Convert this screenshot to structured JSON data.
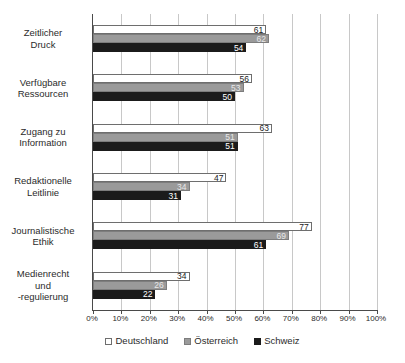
{
  "chart_data": {
    "type": "bar",
    "orientation": "horizontal",
    "title": "",
    "xlabel": "",
    "ylabel": "",
    "xlim": [
      0,
      100
    ],
    "xtick_labels": [
      "0%",
      "10%",
      "20%",
      "30%",
      "40%",
      "50%",
      "60%",
      "70%",
      "80%",
      "90%",
      "100%"
    ],
    "xtick_values": [
      0,
      10,
      20,
      30,
      40,
      50,
      60,
      70,
      80,
      90,
      100
    ],
    "grid": true,
    "legend_position": "bottom",
    "categories": [
      "Zeitlicher Druck",
      "Verfügbare Ressourcen",
      "Zugang zu Information",
      "Redaktionelle Leitlinie",
      "Journalistische Ethik",
      "Medienrecht und -regulierung"
    ],
    "category_lines": [
      [
        "Zeitlicher",
        "Druck"
      ],
      [
        "Verfügbare",
        "Ressourcen"
      ],
      [
        "Zugang zu",
        "Information"
      ],
      [
        "Redaktionelle",
        "Leitlinie"
      ],
      [
        "Journalistische",
        "Ethik"
      ],
      [
        "Medienrecht",
        "und",
        "-regulierung"
      ]
    ],
    "series": [
      {
        "name": "Deutschland",
        "color": "#ffffff",
        "values": [
          61,
          56,
          63,
          47,
          77,
          34
        ]
      },
      {
        "name": "Österreich",
        "color": "#9a9a9a",
        "values": [
          62,
          53,
          51,
          34,
          69,
          26
        ]
      },
      {
        "name": "Schweiz",
        "color": "#1b1b1b",
        "values": [
          54,
          50,
          51,
          31,
          61,
          22
        ]
      }
    ]
  },
  "legend": {
    "items": [
      {
        "label": "Deutschland"
      },
      {
        "label": "Österreich"
      },
      {
        "label": "Schweiz"
      }
    ]
  }
}
